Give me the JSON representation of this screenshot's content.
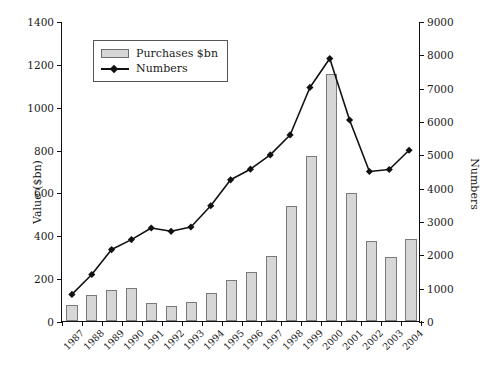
{
  "chart_data": {
    "type": "bar",
    "title": "",
    "xlabel": "",
    "ylabel": "Value ($bn)",
    "y2label": "Numbers",
    "categories": [
      "1987",
      "1988",
      "1989",
      "1990",
      "1991",
      "1992",
      "1993",
      "1994",
      "1995",
      "1996",
      "1997",
      "1998",
      "1999",
      "2000",
      "2001",
      "2002",
      "2003",
      "2004"
    ],
    "ylim": [
      0,
      1400
    ],
    "y2lim": [
      0,
      9000
    ],
    "yticks": [
      0,
      200,
      400,
      600,
      800,
      1000,
      1200,
      1400
    ],
    "y2ticks": [
      0,
      1000,
      2000,
      3000,
      4000,
      5000,
      6000,
      7000,
      8000,
      9000
    ],
    "grid": false,
    "legend_position": "upper-left",
    "series": [
      {
        "name": "Purchases $bn",
        "kind": "bar",
        "axis": "left",
        "color": "#d6d6d6",
        "edge_color": "#7a7a7a",
        "values": [
          75,
          120,
          147,
          155,
          82,
          72,
          87,
          133,
          190,
          227,
          305,
          535,
          770,
          1152,
          598,
          372,
          298,
          385
        ]
      },
      {
        "name": "Numbers",
        "kind": "line",
        "axis": "right",
        "color": "#111111",
        "marker": "diamond",
        "values": [
          800,
          1400,
          2150,
          2450,
          2800,
          2700,
          2830,
          3470,
          4250,
          4570,
          5000,
          5600,
          7030,
          7900,
          6050,
          4500,
          4560,
          5140
        ]
      }
    ]
  },
  "legend": {
    "items": [
      {
        "label": "Purchases $bn",
        "swatch": "bar-swatch"
      },
      {
        "label": "Numbers",
        "swatch": "line-diamond-swatch"
      }
    ]
  }
}
